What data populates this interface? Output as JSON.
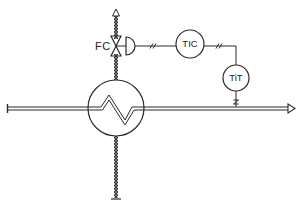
{
  "diagram": {
    "type": "P&ID temperature control loop on heat exchanger",
    "valve": {
      "label": "FC"
    },
    "controller": {
      "label": "TIC"
    },
    "transmitter": {
      "label": "TiT"
    },
    "process_line": {
      "direction": "left-to-right"
    },
    "steam_line": {
      "direction": "bottom-to-top"
    },
    "colors": {
      "line": "#2a2a2a",
      "background": "#ffffff"
    }
  }
}
